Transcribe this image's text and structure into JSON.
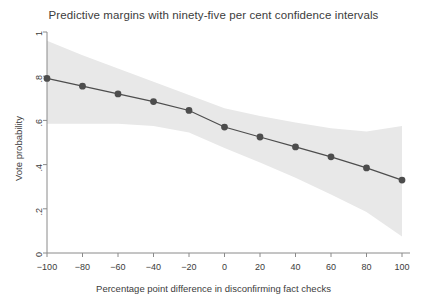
{
  "chart_data": {
    "type": "line",
    "title": "Predictive margins with ninety-five per cent confidence intervals",
    "xlabel": "Percentage point difference in disconfirming fact checks",
    "ylabel": "Vote probability",
    "xlim": [
      -100,
      100
    ],
    "ylim": [
      0,
      1
    ],
    "xticks": [
      -100,
      -80,
      -60,
      -40,
      -20,
      0,
      20,
      40,
      60,
      80,
      100
    ],
    "xticklabels": [
      "−100",
      "−80",
      "−60",
      "−40",
      "−20",
      "0",
      "20",
      "40",
      "60",
      "80",
      "100"
    ],
    "yticks": [
      0,
      0.2,
      0.4,
      0.6,
      0.8,
      1
    ],
    "yticklabels": [
      "0",
      ".2",
      ".4",
      ".6",
      ".8",
      "1"
    ],
    "grid": false,
    "legend": false,
    "x": [
      -100,
      -80,
      -60,
      -40,
      -20,
      0,
      20,
      40,
      60,
      80,
      100
    ],
    "series": [
      {
        "name": "Predictive margin",
        "values": [
          0.79,
          0.755,
          0.72,
          0.685,
          0.645,
          0.57,
          0.525,
          0.48,
          0.435,
          0.385,
          0.33
        ],
        "marker": "circle",
        "color": "#4d4d4d"
      }
    ],
    "confidence_band": {
      "level": 0.95,
      "color": "#e8e8e8",
      "upper": [
        0.96,
        0.895,
        0.835,
        0.775,
        0.715,
        0.655,
        0.62,
        0.59,
        0.565,
        0.55,
        0.575
      ],
      "lower": [
        0.585,
        0.585,
        0.585,
        0.575,
        0.545,
        0.475,
        0.41,
        0.34,
        0.265,
        0.185,
        0.075
      ]
    }
  },
  "colors": {
    "line": "#4d4d4d",
    "marker": "#4d4d4d",
    "band": "#e9e9e9",
    "axis": "#8a8a8a",
    "text": "#3c3c3c",
    "background": "#ffffff"
  }
}
